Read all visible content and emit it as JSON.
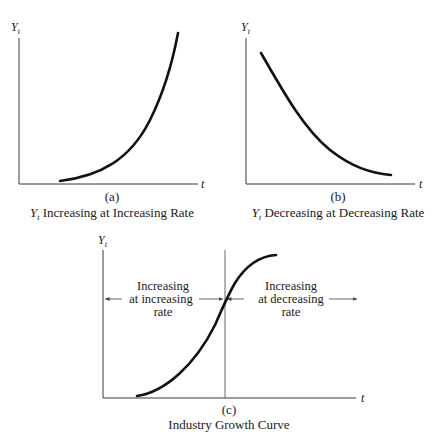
{
  "panels": [
    {
      "id": "a",
      "y_label": "Y",
      "y_label_sub": "t",
      "x_label": "t",
      "tag": "(a)",
      "caption_var": "Y",
      "caption_var_sub": "t",
      "caption_text": " Increasing at Increasing Rate"
    },
    {
      "id": "b",
      "y_label": "Y",
      "y_label_sub": "t",
      "x_label": "t",
      "tag": "(b)",
      "caption_var": "Y",
      "caption_var_sub": "t",
      "caption_text": " Decreasing at Decreasing Rate"
    },
    {
      "id": "c",
      "y_label": "Y",
      "y_label_sub": "t",
      "x_label": "t",
      "tag": "(c)",
      "caption_text": "Industry Growth Curve",
      "left_region": [
        "Increasing",
        "at increasing",
        "rate"
      ],
      "right_region": [
        "Increasing",
        "at decreasing",
        "rate"
      ]
    }
  ],
  "colors": {
    "curve": "#111111",
    "axis": "#3a3a3a",
    "background": "#ffffff"
  }
}
